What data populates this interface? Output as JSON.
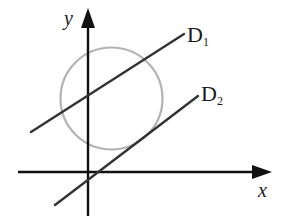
{
  "diagram": {
    "type": "coordinate-geometry",
    "axes": {
      "x_label": "x",
      "y_label": "y",
      "color": "#111111"
    },
    "circle": {
      "color": "#b3b3b3",
      "center_px": [
        111.5,
        98.5
      ],
      "radius_px": 51
    },
    "lines": [
      {
        "name": "D1",
        "letter": "D",
        "subscript": "1",
        "color": "#333333",
        "relation": "secant (intersects circle at two points)"
      },
      {
        "name": "D2",
        "letter": "D",
        "subscript": "2",
        "color": "#333333",
        "relation": "tangent to circle"
      }
    ]
  }
}
